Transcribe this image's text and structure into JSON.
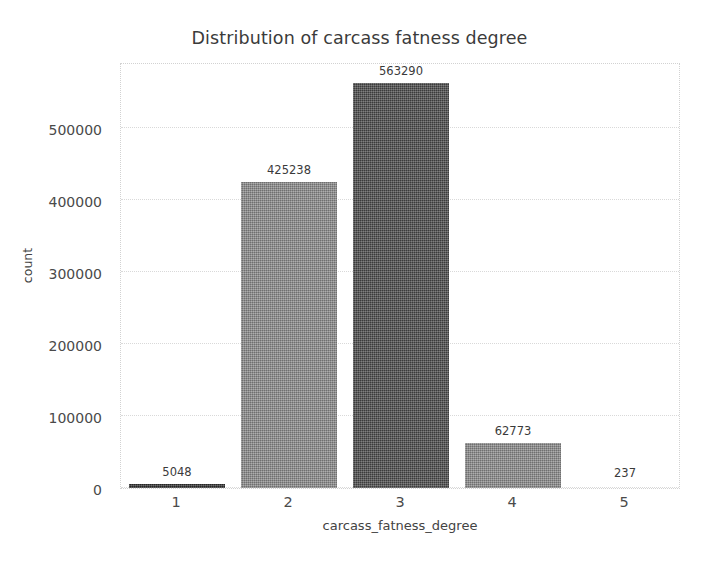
{
  "chart_data": {
    "type": "bar",
    "title": "Distribution of carcass fatness degree",
    "xlabel": "carcass_fatness_degree",
    "ylabel": "count",
    "categories": [
      "1",
      "2",
      "3",
      "4",
      "5"
    ],
    "values": [
      5048,
      425238,
      563290,
      62773,
      237
    ],
    "bar_labels": [
      "5048",
      "425238",
      "563290",
      "62773",
      "237"
    ],
    "bar_colors": [
      "#2f2f2f",
      "#8a8a8a",
      "#4a4a4a",
      "#8a8a8a",
      "#8a8a8a"
    ],
    "ytick_labels": [
      "0",
      "100000",
      "200000",
      "300000",
      "400000",
      "500000"
    ],
    "ytick_values": [
      0,
      100000,
      200000,
      300000,
      400000,
      500000
    ],
    "ylim": [
      0,
      592000
    ],
    "xtick_labels": [
      "1",
      "2",
      "3",
      "4",
      "5"
    ],
    "grid": true,
    "grid_axis": "y",
    "grid_color": "#d9d9d9",
    "legend": "none",
    "background_color": "#ffffff",
    "text_color": "#3b3b3b",
    "annotations": "value labels above each bar"
  }
}
